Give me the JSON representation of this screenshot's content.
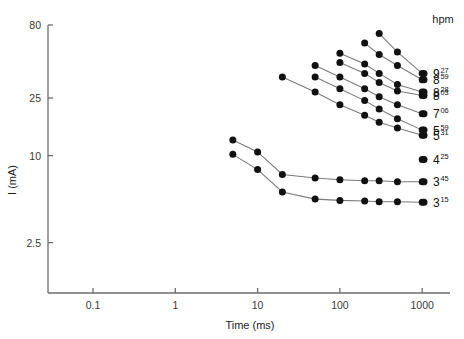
{
  "chart_data": {
    "type": "line",
    "title": "",
    "xlabel": "Time (ms)",
    "ylabel": "I (mA)",
    "xscale": "log",
    "yscale": "log",
    "xlim": [
      0.05,
      1400
    ],
    "ylim": [
      2.0,
      95
    ],
    "xticks": [
      "0.1",
      "1",
      "10",
      "100",
      "1000"
    ],
    "xtick_values": [
      0.1,
      1,
      10,
      100,
      1000
    ],
    "yticks": [
      "80",
      "25",
      "10",
      "2.5"
    ],
    "ytick_values": [
      80,
      25,
      10,
      2.5
    ],
    "grid": false,
    "legend_position": "right",
    "legend_title": "hpm",
    "series": [
      {
        "name": "9",
        "name_sup": "27",
        "x": [
          300,
          500,
          1000
        ],
        "values": [
          70.0,
          52.0,
          37.0
        ]
      },
      {
        "name": "8",
        "name_sup": "59",
        "x": [
          200,
          300,
          500,
          1000
        ],
        "values": [
          60.0,
          50.0,
          42.0,
          33.5
        ]
      },
      {
        "name": "8",
        "name_sup": "28",
        "x": [
          100,
          200,
          300,
          500,
          1000
        ],
        "values": [
          51.0,
          43.0,
          37.0,
          31.0,
          27.5
        ]
      },
      {
        "name": "8",
        "name_sup": "03",
        "x": [
          100,
          200,
          300,
          500,
          1000
        ],
        "values": [
          44.0,
          37.0,
          32.0,
          28.0,
          26.0
        ]
      },
      {
        "name": "7",
        "name_sup": "06",
        "x": [
          50,
          100,
          200,
          300,
          500,
          1000
        ],
        "values": [
          42.0,
          35.0,
          29.0,
          25.5,
          22.5,
          19.5
        ]
      },
      {
        "name": "5",
        "name_sup": "59",
        "x": [
          50,
          100,
          200,
          300,
          500,
          1000
        ],
        "values": [
          35.0,
          29.0,
          24.0,
          21.0,
          18.0,
          15.0
        ]
      },
      {
        "name": "5",
        "name_sup": "31",
        "x": [
          20,
          50,
          100,
          200,
          300,
          500,
          1000
        ],
        "values": [
          35.0,
          27.5,
          22.5,
          19.0,
          17.0,
          15.5,
          13.8
        ]
      },
      {
        "name": "4",
        "name_sup": "25",
        "x": [
          1000
        ],
        "values": [
          9.4
        ]
      },
      {
        "name": "3",
        "name_sup": "45",
        "x": [
          5,
          10,
          20,
          50,
          100,
          200,
          300,
          500,
          1000
        ],
        "values": [
          12.8,
          10.6,
          7.4,
          7.0,
          6.8,
          6.7,
          6.7,
          6.6,
          6.6
        ]
      },
      {
        "name": "3",
        "name_sup": "15",
        "x": [
          5,
          10,
          20,
          50,
          100,
          200,
          300,
          500,
          1000
        ],
        "values": [
          10.2,
          8.0,
          5.6,
          5.0,
          4.9,
          4.85,
          4.8,
          4.8,
          4.75
        ]
      }
    ],
    "legend_entries": [
      {
        "base": "9",
        "sup": "27"
      },
      {
        "base": "8",
        "sup": "59"
      },
      {
        "base": "8",
        "sup": "28"
      },
      {
        "base": "8",
        "sup": "03"
      },
      {
        "base": "7",
        "sup": "06"
      },
      {
        "base": "5",
        "sup": "59"
      },
      {
        "base": "5",
        "sup": "31"
      },
      {
        "base": "4",
        "sup": "25"
      },
      {
        "base": "3",
        "sup": "45"
      },
      {
        "base": "3",
        "sup": "15"
      }
    ],
    "colors": {
      "marker": "#111111",
      "line": "#7b7b7b",
      "axis": "#6d6d6d",
      "text": "#1d1d1d"
    }
  }
}
